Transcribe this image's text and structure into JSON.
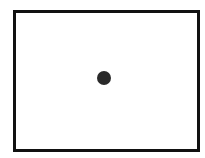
{
  "diagram": {
    "frame": {
      "x": 13,
      "y": 10,
      "width": 181,
      "height": 136,
      "border_color": "#111111",
      "fill": "#ffffff"
    },
    "dot": {
      "cx": 104,
      "cy": 78,
      "diameter": 14,
      "color": "#2a2a2a"
    }
  }
}
